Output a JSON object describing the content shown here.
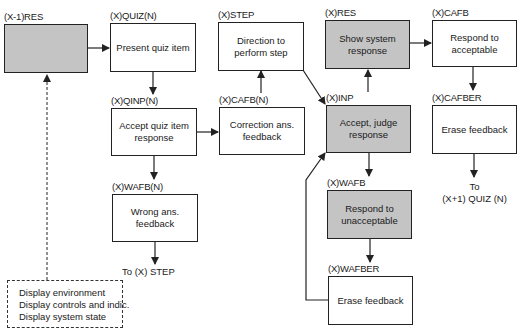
{
  "diagram": {
    "colors": {
      "shaded": "#c4c4c4",
      "line": "#222222",
      "background": "#ffffff"
    },
    "nodes": [
      {
        "id": "prev_res",
        "label": "(X-1)RES",
        "text": "",
        "shaded": true
      },
      {
        "id": "quiz",
        "label": "(X)QUIZ(N)",
        "text": "Present quiz item",
        "shaded": false
      },
      {
        "id": "qinp",
        "label": "(X)QINP(N)",
        "text": "Accept quiz item response",
        "shaded": false
      },
      {
        "id": "wafb_n",
        "label": "(X)WAFB(N)",
        "text": "Wrong ans. feedback",
        "shaded": false
      },
      {
        "id": "step",
        "label": "(X)STEP",
        "text": "Direction to perform step",
        "shaded": false
      },
      {
        "id": "cafb_n",
        "label": "(X)CAFB(N)",
        "text": "Correction ans. feedback",
        "shaded": false
      },
      {
        "id": "res",
        "label": "(X)RES",
        "text": "Show system response",
        "shaded": true
      },
      {
        "id": "inp",
        "label": "(X)INP",
        "text": "Accept, judge response",
        "shaded": true
      },
      {
        "id": "wafb",
        "label": "(X)WAFB",
        "text": "Respond to unacceptable",
        "shaded": true
      },
      {
        "id": "wafber",
        "label": "(X)WAFBER",
        "text": "Erase feedback",
        "shaded": false
      },
      {
        "id": "cafb",
        "label": "(X)CAFB",
        "text": "Respond to acceptable",
        "shaded": false
      },
      {
        "id": "cafber",
        "label": "(X)CAFBER",
        "text": "Erase feedback",
        "shaded": false
      }
    ],
    "notes": {
      "to_step": "To (X) STEP",
      "to_next_quiz_line1": "To",
      "to_next_quiz_line2": "(X+1) QUIZ (N)"
    },
    "environment_box": {
      "lines": [
        "Display environment",
        "Display controls and indic.",
        "Display system state"
      ]
    },
    "edges": [
      {
        "from": "prev_res",
        "to": "quiz",
        "style": "solid"
      },
      {
        "from": "quiz",
        "to": "qinp",
        "style": "solid"
      },
      {
        "from": "qinp",
        "to": "cafb_n",
        "style": "solid"
      },
      {
        "from": "qinp",
        "to": "wafb_n",
        "style": "solid"
      },
      {
        "from": "wafb_n",
        "to": "to_step",
        "style": "solid"
      },
      {
        "from": "cafb_n",
        "to": "step",
        "style": "solid"
      },
      {
        "from": "step",
        "to": "inp",
        "style": "solid"
      },
      {
        "from": "inp",
        "to": "res",
        "style": "solid"
      },
      {
        "from": "inp",
        "to": "wafb",
        "style": "solid"
      },
      {
        "from": "wafb",
        "to": "wafber",
        "style": "solid"
      },
      {
        "from": "wafber",
        "to": "inp",
        "style": "solid"
      },
      {
        "from": "res",
        "to": "cafb",
        "style": "solid"
      },
      {
        "from": "cafb",
        "to": "cafber",
        "style": "solid"
      },
      {
        "from": "cafber",
        "to": "to_next_quiz",
        "style": "solid"
      },
      {
        "from": "environment_box",
        "to": "prev_res",
        "style": "dashed"
      }
    ]
  }
}
